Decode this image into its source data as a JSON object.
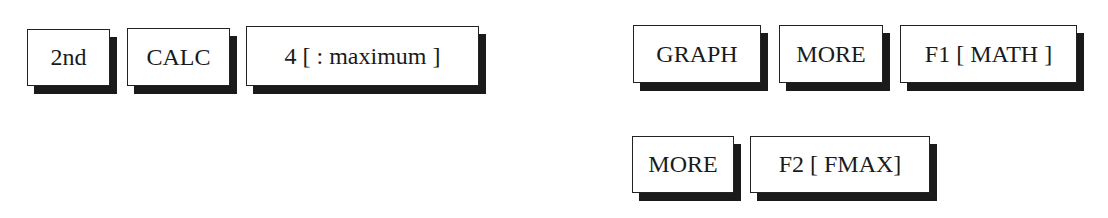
{
  "left_sequence": {
    "keys": [
      {
        "label": "2nd"
      },
      {
        "label": "CALC"
      },
      {
        "label": "4 [ : maximum ]"
      }
    ]
  },
  "right_sequence": {
    "row1": [
      {
        "label": "GRAPH"
      },
      {
        "label": "MORE"
      },
      {
        "label": "F1 [ MATH ]"
      }
    ],
    "row2": [
      {
        "label": "MORE"
      },
      {
        "label": "F2 [ FMAX]"
      }
    ]
  }
}
